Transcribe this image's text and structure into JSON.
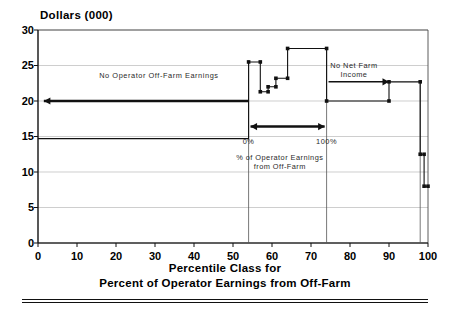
{
  "chart_data": {
    "type": "line",
    "title": "Dollars (000)",
    "ylabel": "Dollars (000)",
    "xlabel": "Percentile Class for Percent of Operator Earnings from Off-Farm",
    "xlabel_line1": "Percentile Class for",
    "xlabel_line2": "Percent of Operator Earnings from Off-Farm",
    "xlim": [
      0,
      100
    ],
    "ylim": [
      0,
      30
    ],
    "xticks": [
      0,
      10,
      20,
      30,
      40,
      50,
      60,
      70,
      80,
      90,
      100
    ],
    "yticks": [
      0,
      5,
      10,
      15,
      20,
      25,
      30
    ],
    "grid": "horizontal",
    "legend": "none",
    "series": [
      {
        "name": "Total Operator Earnings",
        "style": "step",
        "markers": true,
        "steps": [
          {
            "x0": 0,
            "x1": 54,
            "y": 14.7
          },
          {
            "x0": 54,
            "x1": 57,
            "y": 25.5
          },
          {
            "x0": 57,
            "x1": 59,
            "y": 21.3
          },
          {
            "x0": 59,
            "x1": 61,
            "y": 22.0
          },
          {
            "x0": 61,
            "x1": 64,
            "y": 23.2
          },
          {
            "x0": 64,
            "x1": 74,
            "y": 27.4
          },
          {
            "x0": 74,
            "x1": 90,
            "y": 20.0
          },
          {
            "x0": 90,
            "x1": 98,
            "y": 22.7
          },
          {
            "x0": 98,
            "x1": 99,
            "y": 12.5
          },
          {
            "x0": 99,
            "x1": 100,
            "y": 8.0
          }
        ]
      }
    ],
    "annotations": [
      {
        "name": "no-operator-off-farm-earnings",
        "text": "No Operator Off-Farm Earnings",
        "x": 31,
        "y": 23.5
      },
      {
        "name": "no-net-farm-income",
        "text_line1": "No Net Farm",
        "text_line2": "Income",
        "x": 81,
        "y": 25.0
      },
      {
        "name": "pct-operator-earnings-off-farm",
        "text_line1": "% of Operator Earnings",
        "text_line2": "from Off-Farm",
        "x": 62,
        "y": 12.0
      },
      {
        "name": "scale-label-0pct",
        "text": "0%",
        "x": 54,
        "y": 14.2
      },
      {
        "name": "scale-label-100pct",
        "text": "100%",
        "x": 74,
        "y": 14.2
      }
    ],
    "arrows": [
      {
        "name": "no-operator-off-farm-arrow",
        "x0": 54,
        "x1": 1.5,
        "y": 20.0,
        "head": "start",
        "weight": 2.6
      },
      {
        "name": "percent-off-farm-range-arrow",
        "x0": 54.5,
        "x1": 73.5,
        "y": 16.4,
        "head": "both",
        "weight": 2.6
      },
      {
        "name": "no-net-farm-income-arrow",
        "x0": 90,
        "x1": 74.5,
        "y": 22.7,
        "head": "end",
        "weight": 1.5
      }
    ],
    "vertical_markers": [
      {
        "name": "zero-pct-divider",
        "x": 54,
        "y0": 0.0,
        "y1": 25.7
      },
      {
        "name": "hundred-pct-divider",
        "x": 74,
        "y0": 0.0,
        "y1": 27.4
      },
      {
        "name": "right-drop-line",
        "x": 98,
        "y0": 0.0,
        "y1": 22.7
      }
    ]
  }
}
